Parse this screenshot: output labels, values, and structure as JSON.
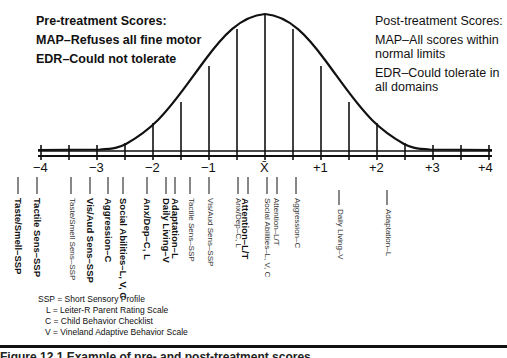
{
  "pre_treatment": {
    "title": "Pre-treatment Scores:",
    "map": "MAP–Refuses all fine motor",
    "edr": "EDR–Could not tolerate"
  },
  "post_treatment": {
    "title": "Post-treatment Scores:",
    "map": "MAP–All scores within normal limits",
    "edr": "EDR–Could tolerate in all domains"
  },
  "axis": {
    "ticks": [
      "−4",
      "−3",
      "−2",
      "−1",
      "X̄",
      "+1",
      "+2",
      "+3",
      "+4"
    ]
  },
  "score_labels": [
    {
      "text": "Taste/Smell–SSP",
      "sd": -4.35,
      "style": "bold"
    },
    {
      "text": "Tactile Sens–SSP",
      "sd": -4.0,
      "style": "bold"
    },
    {
      "text": "Taste/Smell Sens–SSP",
      "sd": -3.4,
      "style": "light"
    },
    {
      "text": "Vis/Aud Sens–SSP",
      "sd": -3.05,
      "style": "bold"
    },
    {
      "text": "Aggression–C",
      "sd": -2.8,
      "style": "bold"
    },
    {
      "text": "Social Abilities–L, V, C",
      "sd": -2.5,
      "style": "bold"
    },
    {
      "text": "Anx/Dep–C, L",
      "sd": -2.1,
      "style": "bold"
    },
    {
      "text": "Daily Living–V",
      "sd": -1.75,
      "style": "bold"
    },
    {
      "text": "Adaptation–L",
      "sd": -1.6,
      "style": "bold"
    },
    {
      "text": "Tactile Sens–SSP",
      "sd": -1.35,
      "style": "light"
    },
    {
      "text": "Vis/Aud Sens–SSP",
      "sd": -1.0,
      "style": "light"
    },
    {
      "text": "Attention–L/T",
      "sd": -0.5,
      "style": "bold"
    },
    {
      "text": "Anx/Dep–C, L",
      "sd": -0.35,
      "style": "light"
    },
    {
      "text": "Social Abilities–L, V, C",
      "sd": 0.15,
      "style": "light"
    },
    {
      "text": "Attention–L/T",
      "sd": 0.05,
      "style": "light"
    },
    {
      "text": "Aggression–C",
      "sd": 0.5,
      "style": "light"
    },
    {
      "text": "Daily Living–V",
      "sd": 1.3,
      "style": "light"
    },
    {
      "text": "Adaptation–L",
      "sd": 2.15,
      "style": "light"
    }
  ],
  "legend": {
    "ssp": "SSP = Short Sensory Profile",
    "l": "L = Leiter-R Parent Rating Scale",
    "c": "C = Child Behavior Checklist",
    "v": "V = Vineland Adaptive Behavior Scale"
  },
  "caption": "Figure 12.1   Example of pre- and post-treatment scores"
}
